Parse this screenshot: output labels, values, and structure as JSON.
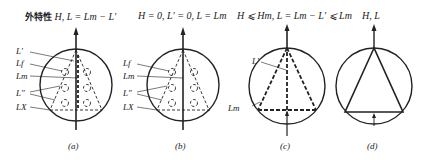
{
  "figure": {
    "panels": [
      {
        "id": "a",
        "title_cn": "外特性",
        "title_formula": "H, L = Lm − L′",
        "labels": [
          "L′",
          "Lf",
          "Lm",
          "L″",
          "LX"
        ],
        "caption": "(a)"
      },
      {
        "id": "b",
        "title_formula": "H = 0, L′ = 0, L = Lm",
        "labels": [
          "Lf",
          "Lm",
          "L″",
          "LX"
        ],
        "caption": "(b)"
      },
      {
        "id": "c",
        "title_formula": "H ⩽ Hm, L = Lm − L′ ⩽ Lm",
        "labels": [
          "L′",
          "Lm"
        ],
        "caption": "(c)"
      },
      {
        "id": "d",
        "title_formula": "H, L",
        "labels": [],
        "caption": "(d)"
      }
    ]
  }
}
